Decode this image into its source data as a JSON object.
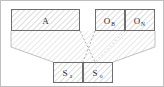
{
  "figure": {
    "type": "block-mapping-diagram",
    "frame": {
      "visible": true,
      "color": "#bfbfbf"
    },
    "fill": {
      "hatch_color": "#b9b9b9",
      "box_stroke": "#6e6e6e",
      "connector_stroke": "#b0b0b0",
      "background": "#ffffff"
    },
    "top_blocks": [
      {
        "id": "A",
        "label": "A",
        "subscript": "",
        "x": 11,
        "y": 9,
        "w": 69,
        "h": 22,
        "hatched": true
      },
      {
        "id": "O_B",
        "label": "O",
        "subscript": "B",
        "x": 95,
        "y": 9,
        "w": 30,
        "h": 22,
        "hatched": true
      },
      {
        "id": "O_N",
        "label": "O",
        "subscript": "N",
        "x": 125,
        "y": 9,
        "w": 30,
        "h": 22,
        "hatched": true
      }
    ],
    "bottom_blocks": [
      {
        "id": "Sa",
        "label": "S",
        "subscript": "a",
        "x": 53,
        "y": 62,
        "w": 30,
        "h": 21,
        "hatched": true
      },
      {
        "id": "So",
        "label": "S",
        "subscript": "o",
        "x": 83,
        "y": 62,
        "w": 30,
        "h": 21,
        "hatched": true
      }
    ],
    "connectors": [
      {
        "id": "A-to-Sa",
        "from": "A",
        "to": "Sa",
        "style": "hatched-funnel"
      },
      {
        "id": "O-to-So",
        "from": "O_N",
        "to": "So",
        "style": "hatched-funnel"
      },
      {
        "id": "A-right-to-So",
        "from": "A",
        "to": "So",
        "style": "dashed-line"
      },
      {
        "id": "OB-to-Sa",
        "from": "O_B",
        "to": "Sa",
        "style": "dashed-line"
      }
    ]
  }
}
